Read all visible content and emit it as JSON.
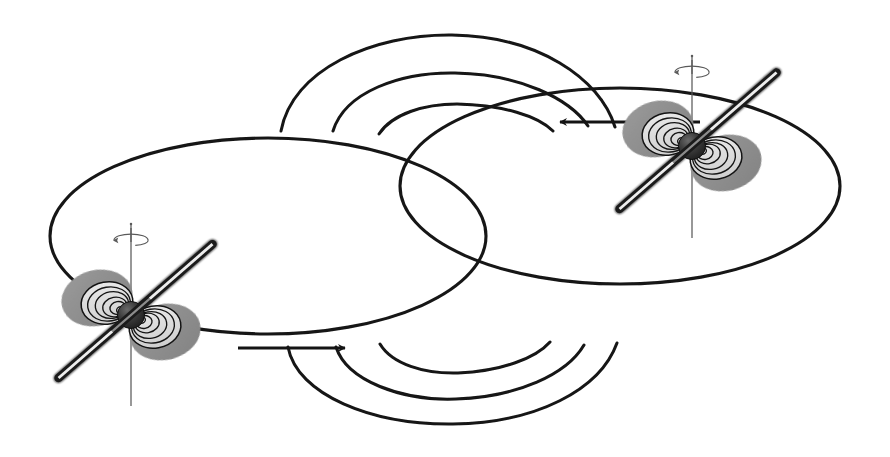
{
  "figure": {
    "kind": "binary-pulsar-orbit-diagram",
    "background_color": "#ffffff",
    "width": 890,
    "height": 457,
    "stroke_color": "#111111",
    "caption": "",
    "title": ""
  },
  "palette": {
    "ink": "#141414",
    "orbit_stroke": "#151515",
    "rod_dark": "#1b1b1b",
    "rod_core": "#ffffff",
    "core_sphere_dark": "#2a2a2a",
    "core_sphere_mid": "#3d3d3d",
    "core_sphere_light": "#5c5c5c",
    "lobe_dark_gray": "#8c8c8c",
    "lobe_mid_gray": "#a8a8a8",
    "beam_light_gray": "#d6d6d6",
    "beam_pale": "#ececec",
    "spin_axis": "#5a5a5a"
  },
  "orbits": [
    {
      "name": "left-orbit-ellipse",
      "cx": 268,
      "cy": 236,
      "rx": 218,
      "ry": 98,
      "stroke_width": 3.1,
      "label": "Left star orbital ellipse"
    },
    {
      "name": "right-orbit-ellipse",
      "cx": 620,
      "cy": 186,
      "rx": 220,
      "ry": 98,
      "stroke_width": 3.1,
      "label": "Right star orbital ellipse"
    }
  ],
  "field_arcs": {
    "top_group_label": "Upper radio beam wavefronts",
    "bottom_group_label": "Lower radio beam wavefronts",
    "top": [
      {
        "name": "top-arc-outer",
        "d": "M 281 131 C 292 70 372 34 452 35 C 537 36 600 78 615 127",
        "stroke_width": 3.0
      },
      {
        "name": "top-arc-middle",
        "d": "M 333 131 C 345 92 400 72 455 73 C 520 74 570 99 588 126",
        "stroke_width": 3.0
      },
      {
        "name": "top-arc-inner",
        "d": "M 379 134 C 392 114 424 104 457 104 C 503 105 538 116 553 131",
        "stroke_width": 3.0
      }
    ],
    "bottom": [
      {
        "name": "bottom-arc-outer",
        "d": "M 288 347 C 297 395 372 425 453 424 C 536 423 600 390 617 343",
        "stroke_width": 3.0
      },
      {
        "name": "bottom-arc-middle",
        "d": "M 336 347 C 347 381 402 401 456 399 C 518 397 567 374 584 345",
        "stroke_width": 3.0
      },
      {
        "name": "bottom-arc-inner",
        "d": "M 380 344 C 392 364 424 374 458 373 C 502 371 536 358 550 342",
        "stroke_width": 3.0
      }
    ]
  },
  "flow_arrows": [
    {
      "name": "upper-flow-arrow",
      "direction": "left",
      "label": "Orbital motion of right pulsar (leftward)",
      "shaft_d": "M 700 122 L 560 122",
      "tip_x": 545,
      "tip_y": 123,
      "tip_rotation": 180,
      "stroke_width": 3.0
    },
    {
      "name": "lower-flow-arrow",
      "direction": "right",
      "label": "Orbital motion of left pulsar (rightward)",
      "shaft_d": "M 238 348 L 345 348",
      "tip_x": 349,
      "tip_y": 348,
      "tip_rotation": 0,
      "stroke_width": 3.0
    }
  ],
  "pulsars": [
    {
      "name": "left-pulsar",
      "label": "Left neutron star (pulsar)",
      "center_x": 131,
      "center_y": 315,
      "sphere_radius": 13.5,
      "magnetic_axis": {
        "name": "left-magnetic-axis-rod",
        "angle_deg": -41,
        "length_positive": 108,
        "length_negative": 96,
        "thickness": 9.5,
        "label": "Magnetic dipole axis"
      },
      "spin_axis": {
        "name": "left-spin-axis",
        "top_y": 228,
        "bottom_y": 406,
        "stroke_width": 1.25,
        "label": "Rotation axis"
      },
      "rotation_marker": {
        "name": "left-rotation-arrow",
        "cx": 131,
        "cy": 240,
        "rx": 17,
        "ry": 6,
        "label": "Spin direction"
      },
      "beams": {
        "count_rings": 5,
        "axis_angle_deg": -41,
        "label": "Radio emission beam cones"
      }
    },
    {
      "name": "right-pulsar",
      "label": "Right neutron star (pulsar)",
      "center_x": 692,
      "center_y": 146,
      "sphere_radius": 13.5,
      "magnetic_axis": {
        "name": "right-magnetic-axis-rod",
        "angle_deg": -41,
        "length_positive": 112,
        "length_negative": 96,
        "thickness": 9.5,
        "label": "Magnetic dipole axis"
      },
      "spin_axis": {
        "name": "right-spin-axis",
        "top_y": 60,
        "bottom_y": 238,
        "stroke_width": 1.25,
        "label": "Rotation axis"
      },
      "rotation_marker": {
        "name": "right-rotation-arrow",
        "cx": 692,
        "cy": 72,
        "rx": 17,
        "ry": 6,
        "label": "Spin direction"
      },
      "beams": {
        "count_rings": 5,
        "axis_angle_deg": -41,
        "label": "Radio emission beam cones"
      }
    }
  ],
  "annotations": {
    "items": []
  }
}
